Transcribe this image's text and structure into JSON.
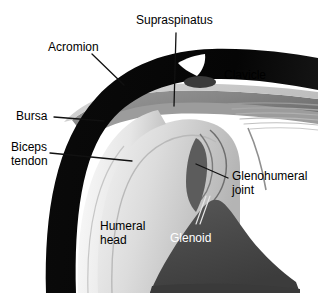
{
  "figure": {
    "type": "anatomical-illustration",
    "background_color": "#ffffff",
    "width": 318,
    "height": 293
  },
  "labels": {
    "supraspinatus": "Supraspinatus",
    "acromion": "Acromion",
    "clavicle": "Clavicle",
    "bursa": "Bursa",
    "biceps_tendon_line1": "Biceps",
    "biceps_tendon_line2": "tendon",
    "glenohumeral_line1": "Glenohumeral",
    "glenohumeral_line2": "joint",
    "humeral_head_line1": "Humeral",
    "humeral_head_line2": "head",
    "glenoid": "Glenoid"
  },
  "colors": {
    "bone_dark": "#000000",
    "scapula_dark_gray": "#4a4a4a",
    "muscle_mid_gray": "#8c8c8c",
    "tendon_light_gray": "#c9c9c9",
    "cartilage_pale": "#e3e3e3",
    "background": "#ffffff",
    "leader_line": "#1a1a1a",
    "label_text": "#000000",
    "label_text_light": "#ffffff"
  },
  "structures": [
    {
      "name": "acromion",
      "tone": "bone_dark",
      "description": "Thick black curved band arching over the top-left of the joint"
    },
    {
      "name": "clavicle",
      "tone": "bone_dark",
      "description": "Black band continuing to the right edge above the joint"
    },
    {
      "name": "supraspinatus",
      "tone": "muscle_mid_gray",
      "description": "Gray tendon band passing beneath the acromion toward the humeral head"
    },
    {
      "name": "bursa",
      "tone": "tendon_light_gray",
      "description": "Thin pale layer between acromion and supraspinatus"
    },
    {
      "name": "biceps-tendon",
      "tone": "cartilage_pale",
      "description": "Pale vertical strip descending along the humeral head"
    },
    {
      "name": "humeral-head",
      "tone": "cartilage_pale",
      "description": "Large rounded pale dome forming the ball of the joint"
    },
    {
      "name": "glenoid",
      "tone": "scapula_dark_gray",
      "description": "Dark gray scapular mass forming the socket at lower right"
    },
    {
      "name": "glenohumeral-joint",
      "tone": "background",
      "description": "Capsule outline space between humeral head and glenoid"
    },
    {
      "name": "joint-capsule-fibers",
      "tone": "muscle_mid_gray",
      "description": "Thin horizontal striations at the right below the clavicle"
    }
  ]
}
